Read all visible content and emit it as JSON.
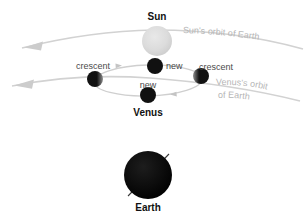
{
  "diagram": {
    "title_visible": false,
    "background_color": "#ffffff",
    "bodies": [
      {
        "id": "sun",
        "label": "Sun",
        "label_position": "above",
        "cx": 157,
        "cy": 41,
        "r": 15,
        "color": "#d9d9d9",
        "style": "light-gray-sphere"
      },
      {
        "id": "venus-new-upper",
        "label": "new",
        "label_position": "right",
        "cx": 155,
        "cy": 66,
        "r": 8,
        "color": "#111111",
        "style": "black-disc"
      },
      {
        "id": "venus-crescent-left",
        "label": "crescent",
        "label_position": "above-left",
        "cx": 95,
        "cy": 79,
        "r": 8,
        "color": "#111111",
        "style": "black-disc-with-limb"
      },
      {
        "id": "venus-crescent-right",
        "label": "crescent",
        "label_position": "above-right",
        "cx": 201,
        "cy": 76,
        "r": 8,
        "color": "#111111",
        "style": "black-disc-with-limb"
      },
      {
        "id": "venus-new-lower",
        "label": "new",
        "label_position": "above",
        "cx": 148,
        "cy": 95,
        "r": 8,
        "color": "#111111",
        "style": "black-disc"
      },
      {
        "id": "venus-group",
        "label": "Venus",
        "label_position": "below",
        "cx": 148,
        "cy": 95,
        "r": 8,
        "color": "#111111",
        "style": "group-label"
      },
      {
        "id": "earth",
        "label": "Earth",
        "label_position": "below",
        "cx": 148,
        "cy": 175,
        "r": 24,
        "color": "#0a0a0a",
        "style": "black-sphere-with-axis"
      }
    ],
    "orbit_labels": [
      {
        "id": "sun-orbit-label",
        "text": "Sun's orbit of Earth",
        "color": "#b6b6b6"
      },
      {
        "id": "venus-orbit-label-line1",
        "text": "Venus's orbit",
        "color": "#b6b6b6"
      },
      {
        "id": "venus-orbit-label-line2",
        "text": "of Earth",
        "color": "#b6b6b6"
      }
    ],
    "orbit_paths": [
      {
        "id": "sun-orbit-path",
        "description": "Sun's orbit of Earth",
        "direction": "leftward",
        "color": "#d2d2d2"
      },
      {
        "id": "venus-orbit-path",
        "description": "Venus's orbit of Earth",
        "direction": "leftward",
        "color": "#d2d2d2"
      },
      {
        "id": "venus-epicycle-path",
        "description": "Venus epicycle around the Sun line",
        "direction": "clockwise",
        "color": "#cfcfcf"
      }
    ],
    "labels": {
      "sun": "Sun",
      "venus": "Venus",
      "earth": "Earth",
      "new_upper": "new",
      "new_lower": "new",
      "crescent_left": "crescent",
      "crescent_right": "crescent",
      "sun_orbit": "Sun's orbit of Earth",
      "venus_orbit_l1": "Venus's orbit",
      "venus_orbit_l2": "of Earth"
    }
  }
}
